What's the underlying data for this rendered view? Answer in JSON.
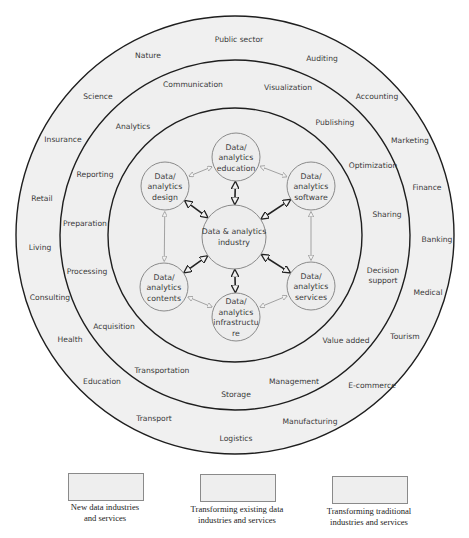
{
  "diagram": {
    "center_node": {
      "line1": "Data & analytics",
      "line2": "industry"
    },
    "inner_nodes": [
      {
        "id": "education",
        "lines": [
          "Data/",
          "analytics",
          "education"
        ]
      },
      {
        "id": "software",
        "lines": [
          "Data/",
          "analytics",
          "software"
        ]
      },
      {
        "id": "services",
        "lines": [
          "Data/",
          "analytics",
          "services"
        ]
      },
      {
        "id": "infrastructure",
        "lines": [
          "Data/",
          "analytics",
          "infrastructu",
          "re"
        ]
      },
      {
        "id": "contents",
        "lines": [
          "Data/",
          "analytics",
          "contents"
        ]
      },
      {
        "id": "design",
        "lines": [
          "Data/",
          "analytics",
          "design"
        ]
      }
    ],
    "middle_ring_labels": [
      "Communication",
      "Visualization",
      "Publishing",
      "Optimization",
      "Sharing",
      "Decision",
      "support",
      "Value added",
      "Management",
      "Storage",
      "Transportation",
      "Acquisition",
      "Processing",
      "Preparation",
      "Reporting",
      "Analytics"
    ],
    "outer_ring_labels": [
      "Public sector",
      "Auditing",
      "Accounting",
      "Marketing",
      "Finance",
      "Banking",
      "Medical",
      "Tourism",
      "E-commerce",
      "Manufacturing",
      "Logistics",
      "Transport",
      "Education",
      "Health",
      "Consulting",
      "Living",
      "Retail",
      "Insurance",
      "Science",
      "Nature"
    ]
  },
  "legend": [
    {
      "line1": "New data industries",
      "line2": "and services"
    },
    {
      "line1": "Transforming existing data",
      "line2": "industries and services"
    },
    {
      "line1": "Transforming traditional",
      "line2": "industries and services"
    }
  ]
}
